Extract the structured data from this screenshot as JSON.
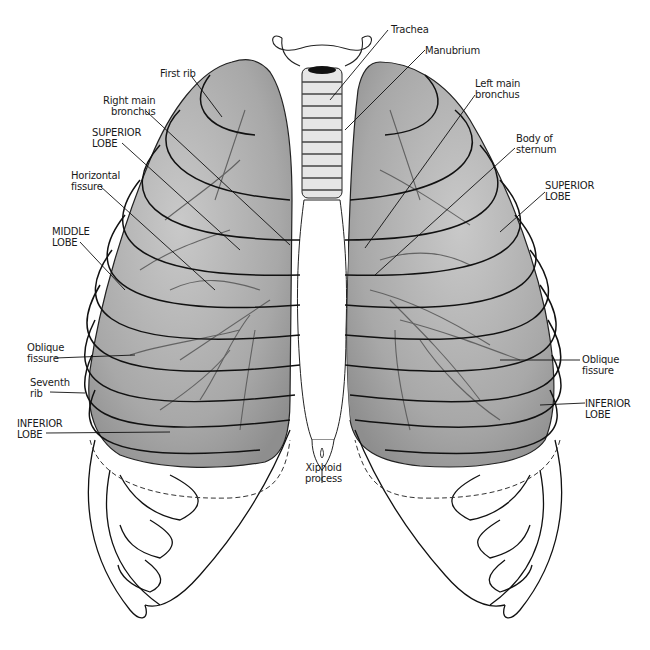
{
  "figure": {
    "colors": {
      "lung_fill": "#a9a9a9",
      "lung_light": "#cfcfcf",
      "vessel": "#5a5a5a",
      "outline": "#111111",
      "background": "#ffffff"
    }
  },
  "labels": {
    "trachea": "Trachea",
    "manubrium": "Manubrium",
    "first_rib": "First rib",
    "right_main_bronchus": "Right main\nbronchus",
    "left_main_bronchus": "Left main\nbronchus",
    "body_of_sternum": "Body of\nsternum",
    "superior_lobe_right": "SUPERIOR\nLOBE",
    "superior_lobe_left": "SUPERIOR\nLOBE",
    "horizontal_fissure": "Horizontal\nfissure",
    "middle_lobe": "MIDDLE\nLOBE",
    "oblique_fissure_right": "Oblique\nfissure",
    "oblique_fissure_left": "Oblique\nfissure",
    "seventh_rib": "Seventh\nrib",
    "inferior_lobe_right": "INFERIOR\nLOBE",
    "inferior_lobe_left": "INFERIOR\nLOBE",
    "xiphoid_process": "Xiphoid\nprocess"
  }
}
